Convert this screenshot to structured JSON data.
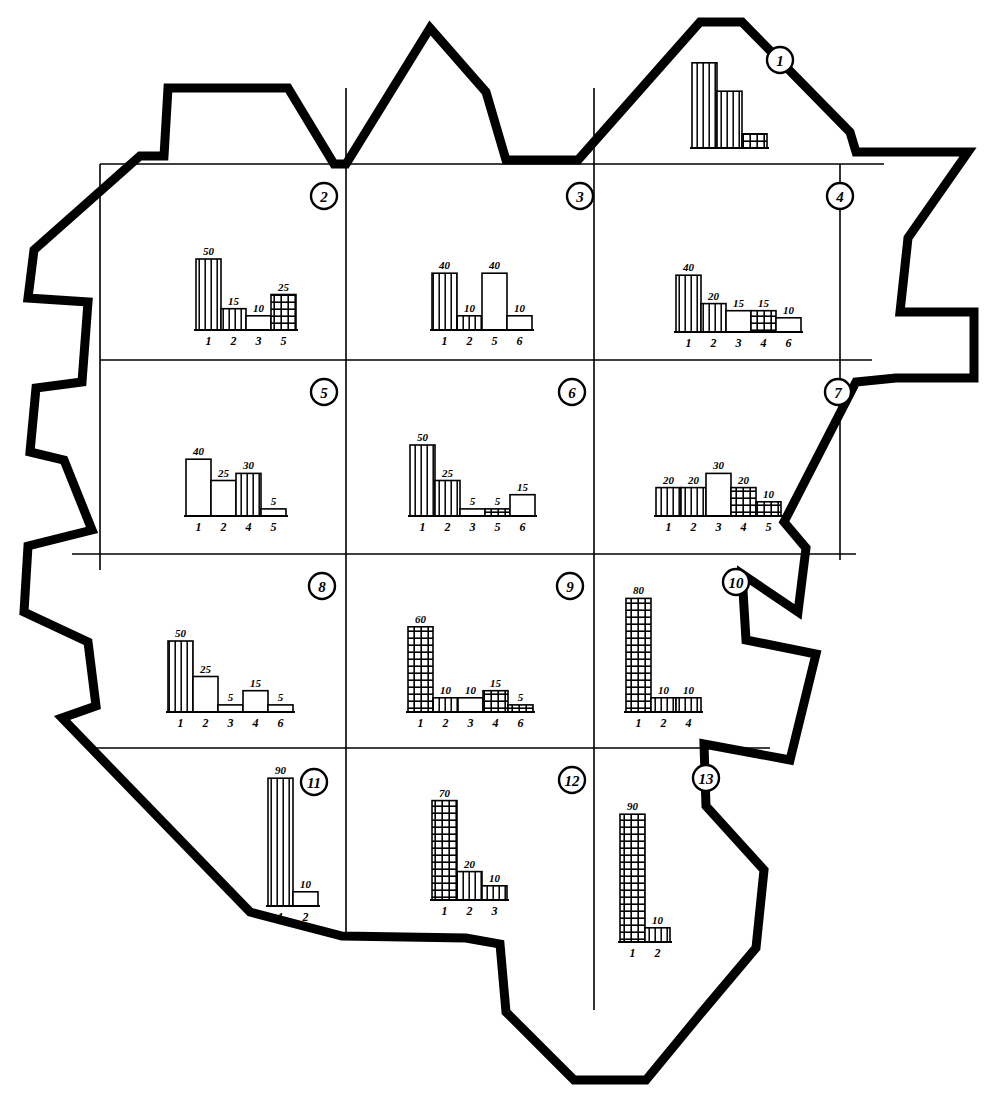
{
  "figure": {
    "type": "choropleth-map-with-bar-charts",
    "title": "",
    "background_color": "#ffffff",
    "ink_color": "#000000",
    "boundary_style": "thick-hand-drawn-outline",
    "grid_style": "thin-straight-lines",
    "district_label_style": "circled-italic-numeral"
  },
  "legend": {
    "fills": {
      "vertical": "vertical-hatch",
      "cross": "cross-hatch-grid",
      "white": "blank-white"
    }
  },
  "map_outline": {
    "name": "region-boundary",
    "points": "430,28 486,92 506,160 578,160 700,22 742,22 850,132 856,152 968,152 908,238 900,312 974,312 974,378 896,378 856,382 784,522 806,548 798,612 742,574 746,640 816,654 790,760 704,744 706,806 764,870 756,948 702,1012 646,1080 574,1080 506,1012 500,944 466,938 342,936 250,912 62,718 96,706 88,642 24,612 28,546 92,530 64,460 30,452 36,388 82,382 88,302 28,298 34,250 140,156 164,156 168,88 288,88 334,164 346,164"
  },
  "grid_lines": {
    "horizontal": [
      {
        "name": "grid-h-1",
        "y": 164,
        "x1": 100,
        "x2": 884
      },
      {
        "name": "grid-h-2",
        "y": 360,
        "x1": 100,
        "x2": 872
      },
      {
        "name": "grid-h-3",
        "y": 554,
        "x1": 72,
        "x2": 856
      },
      {
        "name": "grid-h-4",
        "y": 748,
        "x1": 96,
        "x2": 770
      }
    ],
    "vertical": [
      {
        "name": "grid-v-1",
        "x": 100,
        "y1": 164,
        "y2": 570
      },
      {
        "name": "grid-v-2",
        "x": 346,
        "y1": 88,
        "y2": 936
      },
      {
        "name": "grid-v-3",
        "x": 594,
        "y1": 88,
        "y2": 1010
      },
      {
        "name": "grid-v-4",
        "x": 840,
        "y1": 164,
        "y2": 560
      }
    ]
  },
  "districts": [
    {
      "id": 1,
      "label": "1",
      "marker_x": 780,
      "marker_y": 60,
      "chart_origin_x": 692,
      "chart_origin_y": 148
    },
    {
      "id": 2,
      "label": "2",
      "marker_x": 324,
      "marker_y": 196,
      "chart_origin_x": 196,
      "chart_origin_y": 330
    },
    {
      "id": 3,
      "label": "3",
      "marker_x": 580,
      "marker_y": 196,
      "chart_origin_x": 432,
      "chart_origin_y": 330
    },
    {
      "id": 4,
      "label": "4",
      "marker_x": 840,
      "marker_y": 196,
      "chart_origin_x": 676,
      "chart_origin_y": 332
    },
    {
      "id": 5,
      "label": "5",
      "marker_x": 324,
      "marker_y": 392,
      "chart_origin_x": 186,
      "chart_origin_y": 516
    },
    {
      "id": 6,
      "label": "6",
      "marker_x": 572,
      "marker_y": 392,
      "chart_origin_x": 410,
      "chart_origin_y": 516
    },
    {
      "id": 7,
      "label": "7",
      "marker_x": 838,
      "marker_y": 392,
      "chart_origin_x": 656,
      "chart_origin_y": 516
    },
    {
      "id": 8,
      "label": "8",
      "marker_x": 322,
      "marker_y": 586,
      "chart_origin_x": 168,
      "chart_origin_y": 712
    },
    {
      "id": 9,
      "label": "9",
      "marker_x": 570,
      "marker_y": 586,
      "chart_origin_x": 408,
      "chart_origin_y": 712
    },
    {
      "id": 10,
      "label": "10",
      "marker_x": 736,
      "marker_y": 582,
      "chart_origin_x": 626,
      "chart_origin_y": 712
    },
    {
      "id": 11,
      "label": "11",
      "marker_x": 314,
      "marker_y": 782,
      "chart_origin_x": 268,
      "chart_origin_y": 906
    },
    {
      "id": 12,
      "label": "12",
      "marker_x": 572,
      "marker_y": 780,
      "chart_origin_x": 432,
      "chart_origin_y": 900
    },
    {
      "id": 13,
      "label": "13",
      "marker_x": 706,
      "marker_y": 778,
      "chart_origin_x": 620,
      "chart_origin_y": 942
    }
  ],
  "chart_data": [
    {
      "type": "bar",
      "district": 1,
      "title": "District 1",
      "categories": [
        "",
        "",
        ""
      ],
      "values": [
        60,
        40,
        10
      ],
      "fills": [
        "vertical",
        "vertical",
        "cross-white"
      ],
      "labels_shown": false,
      "xlabel": "",
      "ylabel": "",
      "ylim": [
        0,
        90
      ]
    },
    {
      "type": "bar",
      "district": 2,
      "title": "District 2",
      "categories": [
        "1",
        "2",
        "3",
        "5"
      ],
      "values": [
        50,
        15,
        10,
        25
      ],
      "fills": [
        "vertical",
        "vertical",
        "white",
        "cross"
      ],
      "labels_shown": true,
      "xlabel": "",
      "ylabel": "",
      "ylim": [
        0,
        90
      ]
    },
    {
      "type": "bar",
      "district": 3,
      "title": "District 3",
      "categories": [
        "1",
        "2",
        "5",
        "6"
      ],
      "values": [
        40,
        10,
        40,
        10
      ],
      "fills": [
        "vertical",
        "vertical",
        "white",
        "white"
      ],
      "labels_shown": true,
      "xlabel": "",
      "ylabel": "",
      "ylim": [
        0,
        90
      ]
    },
    {
      "type": "bar",
      "district": 4,
      "title": "District 4",
      "categories": [
        "1",
        "2",
        "3",
        "4",
        "6"
      ],
      "values": [
        40,
        20,
        15,
        15,
        10
      ],
      "fills": [
        "vertical",
        "vertical",
        "white",
        "cross",
        "white"
      ],
      "labels_shown": true,
      "xlabel": "",
      "ylabel": "",
      "ylim": [
        0,
        90
      ]
    },
    {
      "type": "bar",
      "district": 5,
      "title": "District 5",
      "categories": [
        "1",
        "2",
        "4",
        "5"
      ],
      "values": [
        40,
        25,
        30,
        5
      ],
      "fills": [
        "white",
        "white",
        "vertical",
        "white"
      ],
      "labels_shown": true,
      "xlabel": "",
      "ylabel": "",
      "ylim": [
        0,
        90
      ]
    },
    {
      "type": "bar",
      "district": 6,
      "title": "District 6",
      "categories": [
        "1",
        "2",
        "3",
        "5",
        "6"
      ],
      "values": [
        50,
        25,
        5,
        5,
        15
      ],
      "fills": [
        "vertical",
        "vertical",
        "white",
        "cross",
        "white"
      ],
      "labels_shown": true,
      "xlabel": "",
      "ylabel": "",
      "ylim": [
        0,
        90
      ]
    },
    {
      "type": "bar",
      "district": 7,
      "title": "District 7",
      "categories": [
        "1",
        "2",
        "3",
        "4",
        "5"
      ],
      "values": [
        20,
        20,
        30,
        20,
        10
      ],
      "fills": [
        "vertical",
        "vertical",
        "white",
        "cross",
        "cross"
      ],
      "labels_shown": true,
      "xlabel": "",
      "ylabel": "",
      "ylim": [
        0,
        90
      ]
    },
    {
      "type": "bar",
      "district": 8,
      "title": "District 8",
      "categories": [
        "1",
        "2",
        "3",
        "4",
        "6"
      ],
      "values": [
        50,
        25,
        5,
        15,
        5
      ],
      "fills": [
        "vertical",
        "white",
        "white",
        "white",
        "white"
      ],
      "labels_shown": true,
      "xlabel": "",
      "ylabel": "",
      "ylim": [
        0,
        90
      ]
    },
    {
      "type": "bar",
      "district": 9,
      "title": "District 9",
      "categories": [
        "1",
        "2",
        "3",
        "4",
        "6"
      ],
      "values": [
        60,
        10,
        10,
        15,
        5
      ],
      "fills": [
        "cross",
        "vertical",
        "white",
        "cross",
        "cross"
      ],
      "labels_shown": true,
      "xlabel": "",
      "ylabel": "",
      "ylim": [
        0,
        90
      ]
    },
    {
      "type": "bar",
      "district": 10,
      "title": "District 10",
      "categories": [
        "1",
        "2",
        "4"
      ],
      "values": [
        80,
        10,
        10
      ],
      "fills": [
        "cross",
        "vertical",
        "vertical"
      ],
      "labels_shown": true,
      "xlabel": "",
      "ylabel": "",
      "ylim": [
        0,
        90
      ]
    },
    {
      "type": "bar",
      "district": 11,
      "title": "District 11",
      "categories": [
        "1",
        "2"
      ],
      "values": [
        90,
        10
      ],
      "fills": [
        "vertical",
        "white"
      ],
      "labels_shown": true,
      "xlabel": "",
      "ylabel": "",
      "ylim": [
        0,
        90
      ]
    },
    {
      "type": "bar",
      "district": 12,
      "title": "District 12",
      "categories": [
        "1",
        "2",
        "3"
      ],
      "values": [
        70,
        20,
        10
      ],
      "fills": [
        "cross",
        "vertical",
        "vertical"
      ],
      "labels_shown": true,
      "xlabel": "",
      "ylabel": "",
      "ylim": [
        0,
        90
      ]
    },
    {
      "type": "bar",
      "district": 13,
      "title": "District 13",
      "categories": [
        "1",
        "2"
      ],
      "values": [
        90,
        10
      ],
      "fills": [
        "cross",
        "vertical"
      ],
      "labels_shown": true,
      "xlabel": "",
      "ylabel": "",
      "ylim": [
        0,
        90
      ]
    }
  ]
}
